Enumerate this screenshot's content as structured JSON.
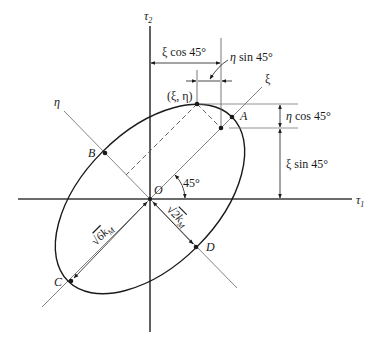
{
  "figure": {
    "axes": {
      "horizontal": {
        "symbol": "τ",
        "subscript": "1"
      },
      "vertical": {
        "symbol": "τ",
        "subscript": "2"
      },
      "rotated_major": {
        "symbol": "ξ"
      },
      "rotated_minor": {
        "symbol": "η"
      }
    },
    "origin_label": "O",
    "points": {
      "A": "A",
      "B": "B",
      "C": "C",
      "D": "D",
      "xi_eta": "(ξ, η)"
    },
    "angle_label": "45°",
    "dimensions": {
      "xi_cos": "ξ cos 45°",
      "eta_sin": "η sin 45°",
      "eta_cos": "η cos 45°",
      "xi_sin": "ξ sin 45°",
      "major_semi": {
        "root": "6k",
        "sub": "M"
      },
      "minor_semi": {
        "root": "2k",
        "sub": "M"
      }
    },
    "colors": {
      "axis": "#3a3a3a",
      "curve": "#1a1a1a",
      "thin_line": "#777777",
      "text": "#1a1a1a"
    }
  }
}
